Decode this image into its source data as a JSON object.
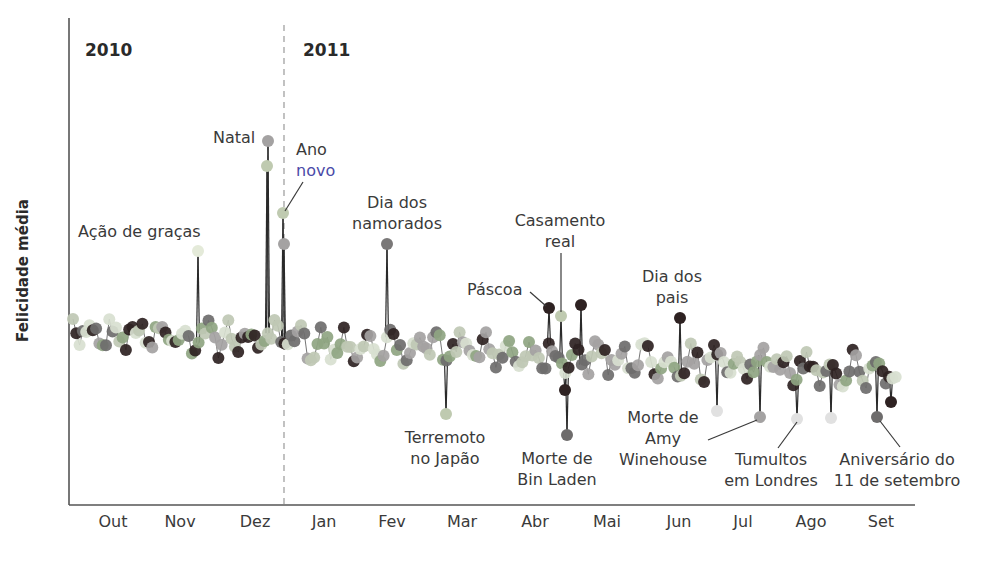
{
  "chart_data": {
    "type": "scatter",
    "title": "",
    "ylabel": "Felicidade média",
    "xlabel": "",
    "years": [
      {
        "label": "2010",
        "x": 85
      },
      {
        "label": "2011",
        "x": 300
      }
    ],
    "year_divider_x": 284,
    "categories": [
      "Out",
      "Nov",
      "Dez",
      "Jan",
      "Fev",
      "Mar",
      "Abr",
      "Mai",
      "Jun",
      "Jul",
      "Ago",
      "Set"
    ],
    "month_label_x": [
      113,
      180,
      255,
      324,
      392,
      462,
      535,
      607,
      679,
      743,
      811,
      881
    ],
    "axes": {
      "x0": 69,
      "x1": 915,
      "y_top": 18,
      "y_bottom": 505
    },
    "grid": false,
    "legend": null,
    "palette": [
      "#a4a2a2",
      "#2e2222",
      "#8fa582",
      "#d8dfd0",
      "#6e6c6c",
      "#bfc8b4"
    ],
    "baseline": {
      "start_y": 330,
      "end_y": 372,
      "amplitude": 22
    },
    "events": [
      {
        "name": "Ação de graças",
        "x": 198,
        "y": 251,
        "color": "#e4ead9"
      },
      {
        "name": "Natal",
        "x": 268,
        "y": 141,
        "color": "#a4a2a2"
      },
      {
        "name": "Natal (véspera)",
        "x": 267,
        "y": 166,
        "color": "#bfcab0"
      },
      {
        "name": "Ano novo",
        "x": 283,
        "y": 213,
        "color": "#bfcab0"
      },
      {
        "name": "Ano novo (2)",
        "x": 284,
        "y": 244,
        "color": "#a4a2a2"
      },
      {
        "name": "Dia dos namorados",
        "x": 387,
        "y": 244,
        "color": "#7a7878"
      },
      {
        "name": "Terremoto no Japão",
        "x": 446,
        "y": 414,
        "color": "#bfcab0"
      },
      {
        "name": "Páscoa",
        "x": 549,
        "y": 308,
        "color": "#2e2222"
      },
      {
        "name": "Casamento real",
        "x": 561,
        "y": 316,
        "color": "#bfcab0"
      },
      {
        "name": "Morte de Bin Laden",
        "x": 567,
        "y": 435,
        "color": "#6e6c6c"
      },
      {
        "name": "Morte de Bin Laden (2)",
        "x": 565,
        "y": 390,
        "color": "#2e2222"
      },
      {
        "name": "Pico abril",
        "x": 581,
        "y": 305,
        "color": "#2e2222"
      },
      {
        "name": "Dia dos pais",
        "x": 680,
        "y": 318,
        "color": "#2e2222"
      },
      {
        "name": "Queda julho",
        "x": 717,
        "y": 411,
        "color": "#e1e1e1"
      },
      {
        "name": "Morte de Amy Winehouse",
        "x": 760,
        "y": 417,
        "color": "#a4a2a2"
      },
      {
        "name": "Tumultos em Londres",
        "x": 797,
        "y": 419,
        "color": "#e1e1e1"
      },
      {
        "name": "Queda agosto",
        "x": 831,
        "y": 418,
        "color": "#e1e1e1"
      },
      {
        "name": "Aniversário do 11 de setembro",
        "x": 877,
        "y": 417,
        "color": "#6e6c6c"
      },
      {
        "name": "Final setembro",
        "x": 891,
        "y": 402,
        "color": "#2e2222"
      }
    ],
    "annotations": [
      {
        "id": "acao",
        "lines": [
          "Ação de graças"
        ],
        "x": 78,
        "y": 221,
        "align": "left"
      },
      {
        "id": "natal",
        "lines": [
          "Natal"
        ],
        "x": 213,
        "y": 127,
        "align": "left"
      },
      {
        "id": "anonovo",
        "lines": [
          "Ano",
          "novo"
        ],
        "x": 296,
        "y": 139,
        "align": "left"
      },
      {
        "id": "namorados",
        "lines": [
          "Dia dos",
          "namorados"
        ],
        "x": 397,
        "y": 192,
        "align": "center"
      },
      {
        "id": "pascoa",
        "lines": [
          "Páscoa"
        ],
        "x": 467,
        "y": 279,
        "align": "left"
      },
      {
        "id": "casamento",
        "lines": [
          "Casamento",
          "real"
        ],
        "x": 560,
        "y": 210,
        "align": "center"
      },
      {
        "id": "pais",
        "lines": [
          "Dia dos",
          "pais"
        ],
        "x": 672,
        "y": 266,
        "align": "center"
      },
      {
        "id": "terremoto",
        "lines": [
          "Terremoto",
          "no Japão"
        ],
        "x": 445,
        "y": 427,
        "align": "center"
      },
      {
        "id": "binladen",
        "lines": [
          "Morte de",
          "Bin Laden"
        ],
        "x": 557,
        "y": 448,
        "align": "center"
      },
      {
        "id": "amy",
        "lines": [
          "Morte de",
          "Amy",
          "Winehouse"
        ],
        "x": 663,
        "y": 407,
        "align": "center"
      },
      {
        "id": "tumultos",
        "lines": [
          "Tumultos",
          "em Londres"
        ],
        "x": 771,
        "y": 449,
        "align": "center"
      },
      {
        "id": "setembro",
        "lines": [
          "Aniversário do",
          "11 de setembro"
        ],
        "x": 897,
        "y": 449,
        "align": "center"
      }
    ],
    "leaders": [
      {
        "id": "anonovo",
        "x1": 303,
        "y1": 182,
        "x2": 285,
        "y2": 211
      },
      {
        "id": "pascoa",
        "x1": 530,
        "y1": 292,
        "x2": 546,
        "y2": 306
      },
      {
        "id": "casamento",
        "x1": 561,
        "y1": 253,
        "x2": 561,
        "y2": 312
      },
      {
        "id": "amy",
        "x1": 708,
        "y1": 440,
        "x2": 757,
        "y2": 420
      },
      {
        "id": "tumultos",
        "x1": 778,
        "y1": 448,
        "x2": 797,
        "y2": 422
      },
      {
        "id": "setembro",
        "x1": 900,
        "y1": 447,
        "x2": 880,
        "y2": 421
      }
    ]
  }
}
